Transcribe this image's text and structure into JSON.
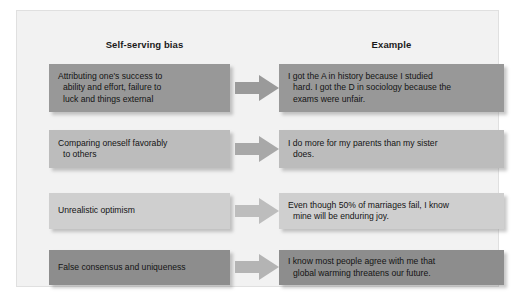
{
  "figure": {
    "background_color": "#f2f2f2",
    "border_color": "#e0e0e0"
  },
  "columns": {
    "left_header": "Self-serving bias",
    "right_header": "Example"
  },
  "rows": [
    {
      "bias": "Attributing one's success to\nability and effort, failure to\nluck and things external",
      "example": "I got the A in history because I studied\nhard. I got the D in sociology because the\nexams were unfair.",
      "left_color": "#989898",
      "right_color": "#989898",
      "arrow_color": "#9a9a9a",
      "top": 53,
      "height": 48,
      "arrow_top": 64
    },
    {
      "bias": "Comparing oneself favorably\nto others",
      "example": "I do more for my parents than my sister\ndoes.",
      "left_color": "#bcbcbc",
      "right_color": "#bcbcbc",
      "arrow_color": "#a8a8a8",
      "top": 119,
      "height": 38,
      "arrow_top": 125
    },
    {
      "bias": "Unrealistic optimism",
      "example": "Even though 50% of marriages fail, I know\nmine will be enduring joy.",
      "left_color": "#cfcfcf",
      "right_color": "#cfcfcf",
      "arrow_color": "#bdbdbd",
      "top": 182,
      "height": 36,
      "arrow_top": 187
    },
    {
      "bias": "False consensus and uniqueness",
      "example": "I know most people agree with me that\nglobal warming threatens our future.",
      "left_color": "#8d8d8d",
      "right_color": "#8d8d8d",
      "arrow_color": "#b4b4b4",
      "top": 239,
      "height": 35,
      "arrow_top": 243
    }
  ],
  "icons": {
    "arrow": "right-block-arrow"
  }
}
